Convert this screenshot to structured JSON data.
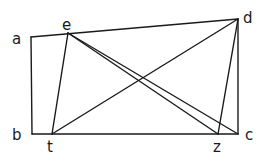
{
  "diagram": {
    "type": "geometry",
    "points": {
      "a": {
        "x": 31,
        "y": 37
      },
      "e": {
        "x": 68,
        "y": 33
      },
      "d": {
        "x": 238,
        "y": 19
      },
      "b": {
        "x": 32,
        "y": 134
      },
      "t": {
        "x": 52,
        "y": 134
      },
      "z": {
        "x": 218,
        "y": 134
      },
      "c": {
        "x": 238,
        "y": 134
      }
    },
    "segments": [
      [
        "a",
        "d"
      ],
      [
        "a",
        "b"
      ],
      [
        "b",
        "c"
      ],
      [
        "d",
        "c"
      ],
      [
        "e",
        "t"
      ],
      [
        "t",
        "d"
      ],
      [
        "d",
        "z"
      ],
      [
        "e",
        "z"
      ],
      [
        "e",
        "c"
      ]
    ],
    "labels": [
      {
        "text": "a",
        "x": 12,
        "y": 44
      },
      {
        "text": "e",
        "x": 62,
        "y": 30
      },
      {
        "text": "d",
        "x": 243,
        "y": 23
      },
      {
        "text": "b",
        "x": 12,
        "y": 140
      },
      {
        "text": "t",
        "x": 47,
        "y": 152
      },
      {
        "text": "z",
        "x": 213,
        "y": 152
      },
      {
        "text": "c",
        "x": 245,
        "y": 140
      }
    ]
  }
}
